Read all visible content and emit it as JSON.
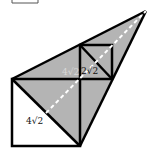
{
  "diagram": {
    "type": "geometry-figure",
    "colors": {
      "shade": "#b4b4b4",
      "stroke": "#000000",
      "dashed": "#ffffff",
      "background": "#ffffff"
    },
    "labels": {
      "big_diagonal": "4√2",
      "small_diagonal": "2√2",
      "faint_label": "4√2"
    }
  }
}
